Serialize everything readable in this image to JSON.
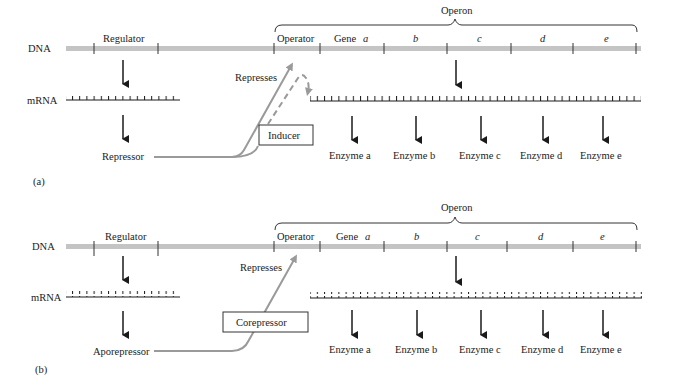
{
  "colors": {
    "dna_bar": "#c4c4c4",
    "arrow_gray": "#9a9a9a",
    "ink": "#1a1a1a",
    "background": "#ffffff"
  },
  "panels": [
    {
      "id": "a",
      "panel_label": "(a)",
      "dna_label": "DNA",
      "mrna_label": "mRNA",
      "regulator_label": "Regulator",
      "operon_label": "Operon",
      "operator_label": "Operator",
      "gene_label": "Gene",
      "genes": [
        "a",
        "b",
        "c",
        "d",
        "e"
      ],
      "represses_label": "Represses",
      "protein_label": "Repressor",
      "effector_label": "Inducer",
      "enzymes": [
        "Enzyme a",
        "Enzyme b",
        "Enzyme c",
        "Enzyme d",
        "Enzyme e"
      ]
    },
    {
      "id": "b",
      "panel_label": "(b)",
      "dna_label": "DNA",
      "mrna_label": "mRNA",
      "regulator_label": "Regulator",
      "operon_label": "Operon",
      "operator_label": "Operator",
      "gene_label": "Gene",
      "genes": [
        "a",
        "b",
        "c",
        "d",
        "e"
      ],
      "represses_label": "Represses",
      "protein_label": "Aporepressor",
      "effector_label": "Corepressor",
      "enzymes": [
        "Enzyme a",
        "Enzyme b",
        "Enzyme c",
        "Enzyme d",
        "Enzyme e"
      ]
    }
  ]
}
